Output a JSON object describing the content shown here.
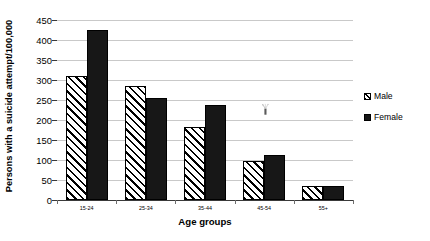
{
  "chart_data": {
    "type": "bar",
    "title": "",
    "xlabel": "Age groups",
    "ylabel": "Persons with a suicide attempt/100,000",
    "categories": [
      "15-24",
      "25-34",
      "35-44",
      "45-54",
      "55+"
    ],
    "series": [
      {
        "name": "Male",
        "values": [
          310,
          285,
          183,
          97,
          36
        ]
      },
      {
        "name": "Female",
        "values": [
          425,
          254,
          237,
          113,
          36
        ]
      }
    ],
    "ylim": [
      0,
      450
    ],
    "ytick_step": 50,
    "yticks": [
      0,
      50,
      100,
      150,
      200,
      250,
      300,
      350,
      400,
      450
    ],
    "ytick_labels": [
      "0",
      "50",
      "100",
      "150",
      "200",
      "250",
      "300",
      "350",
      "400",
      "450"
    ],
    "grid": "horizontal",
    "legend_position": "right",
    "legend": [
      "Male",
      "Female"
    ],
    "colors": {
      "male_fill": "#ffffff",
      "male_hatch": "#000000",
      "female_fill": "#171717",
      "gridline": "#c9c9c9",
      "axis": "#3a3a3a",
      "text": "#000000"
    }
  },
  "axes": {
    "y_title": "Persons with a suicide attempt/100,000",
    "x_title": "Age groups"
  },
  "legend": {
    "items": [
      {
        "label": "Male",
        "swatch": "hatched-diagonal-swatch"
      },
      {
        "label": "Female",
        "swatch": "solid-black-swatch"
      }
    ]
  }
}
